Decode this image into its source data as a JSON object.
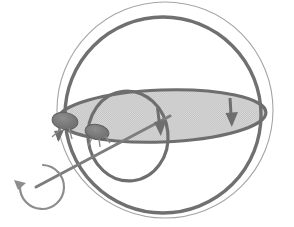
{
  "figure": {
    "title": "Rotating sphere with equatorial orbit and spin axis",
    "caption": "",
    "width": 294,
    "height": 227,
    "background_color": "#ffffff"
  },
  "colors": {
    "sphere_outline": "#9a9a9a",
    "great_circle": "#6e6e6e",
    "equator_outline": "#6e6e6e",
    "equator_fill": "#cfcfcf",
    "inner_loop": "#6e6e6e",
    "axis_line": "#7a7a7a",
    "spin_arrow": "#8a8a8a",
    "marker_fill": "#7b7b7b",
    "arrowhead": "#6e6e6e"
  },
  "elements": {
    "sphere": {
      "name": "sphere-outline",
      "shape": "circle",
      "cx": 165,
      "cy": 110,
      "r": 108,
      "stroke_width": 1.1,
      "fill": "none"
    },
    "great_circle": {
      "name": "great-circle",
      "shape": "circle",
      "cx": 163,
      "cy": 115,
      "r": 98,
      "stroke_width": 3.4,
      "fill": "none"
    },
    "equator": {
      "name": "equator-ellipse",
      "shape": "ellipse",
      "cx": 162,
      "cy": 116,
      "rx": 104,
      "ry": 26,
      "rotation_deg": -2,
      "stroke_width": 3.2,
      "fill": "shaded"
    },
    "inner_loop": {
      "name": "inner-loop",
      "shape": "ellipse",
      "cx": 128,
      "cy": 136,
      "rx": 40,
      "ry": 45,
      "rotation_deg": -6,
      "stroke_width": 3.2,
      "fill": "none"
    },
    "axis": {
      "name": "rotation-axis-line",
      "shape": "line",
      "x1": 38,
      "y1": 186,
      "x2": 168,
      "y2": 117,
      "stroke_width": 3.0
    },
    "spin_arrow": {
      "name": "spin-direction-arrow",
      "shape": "arc-arrow",
      "cx": 42,
      "cy": 184,
      "r": 22,
      "start_deg": -40,
      "sweep_deg": 275,
      "stroke_width": 2.2,
      "direction": "counterclockwise"
    },
    "markers": [
      {
        "name": "particle-marker-left",
        "cx": 64,
        "cy": 120,
        "rx": 12,
        "ry": 8,
        "rotation_deg": 8
      },
      {
        "name": "particle-marker-inner",
        "cx": 96,
        "cy": 131,
        "rx": 11,
        "ry": 7,
        "rotation_deg": 10
      }
    ],
    "arrowheads": [
      {
        "name": "equator-arrowhead-right",
        "x": 242,
        "y": 117,
        "angle_deg": 90,
        "size": 11,
        "label": "down"
      },
      {
        "name": "equator-arrowhead-center",
        "x": 163,
        "y": 128,
        "angle_deg": 90,
        "size": 11,
        "label": "down"
      },
      {
        "name": "axis-arrowhead-left",
        "x": 60,
        "y": 132,
        "angle_deg": 105,
        "size": 9,
        "label": "down-left"
      }
    ]
  },
  "annotations": {
    "labels": []
  }
}
